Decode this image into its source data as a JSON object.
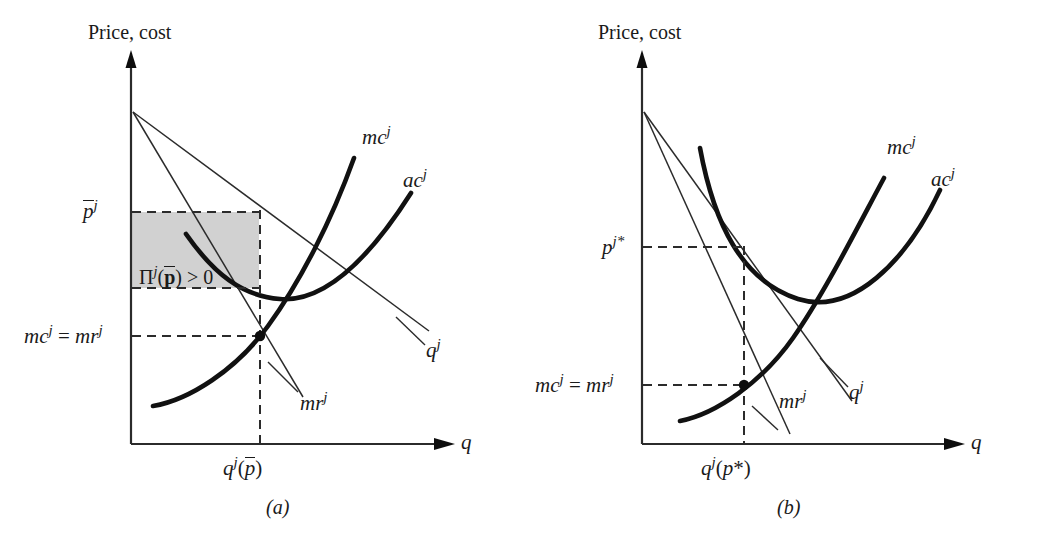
{
  "figure": {
    "width": 1038,
    "height": 546,
    "background": "#ffffff",
    "ink_color": "#1a1a1a",
    "shade_color": "#cfcfcf"
  },
  "panels": [
    {
      "id": "panel-a",
      "caption": "(a)",
      "y_axis_label": "Price, cost",
      "x_axis_label": "q",
      "price_tick_label": "p̄",
      "price_tick_sup": "j",
      "cost_tick_label": "mc",
      "cost_tick_text": "mc j = mr j",
      "x_tick_label": "q j(p̄)",
      "profit_label": "Π j(p̄) > 0",
      "profit_sign": "> 0",
      "curves": [
        {
          "name": "mc",
          "label": "mc",
          "sup": "j",
          "style": "thick"
        },
        {
          "name": "ac",
          "label": "ac",
          "sup": "j",
          "style": "thick"
        },
        {
          "name": "demand",
          "label": "q",
          "sup": "j",
          "style": "thin"
        },
        {
          "name": "marginal-revenue",
          "label": "mr",
          "sup": "j",
          "style": "thin"
        }
      ],
      "shaded_region": true,
      "shaded_region_meaning": "positive profit"
    },
    {
      "id": "panel-b",
      "caption": "(b)",
      "y_axis_label": "Price, cost",
      "x_axis_label": "q",
      "price_tick_label": "p",
      "price_tick_sup": "j*",
      "cost_tick_text": "mc j = mr j",
      "x_tick_label": "q j(p*)",
      "curves": [
        {
          "name": "mc",
          "label": "mc",
          "sup": "j",
          "style": "thick"
        },
        {
          "name": "ac",
          "label": "ac",
          "sup": "j",
          "style": "thick"
        },
        {
          "name": "demand",
          "label": "q",
          "sup": "j",
          "style": "thin"
        },
        {
          "name": "marginal-revenue",
          "label": "mr",
          "sup": "j",
          "style": "thin"
        }
      ],
      "shaded_region": false
    }
  ],
  "labels": {
    "price_cost": "Price, cost",
    "q_axis": "q",
    "mc": "mc",
    "ac": "ac",
    "mr": "mr",
    "qd": "q",
    "sup_j": "j",
    "p_bar": "p",
    "p_star_sup": "j*",
    "eq_mc_mr_left": "mc",
    "eq_symbol": " = ",
    "eq_mc_mr_right": "mr",
    "profit_pi": "Π",
    "profit_open": "(",
    "profit_p": "p",
    "profit_close": ")",
    "profit_gt": " > 0",
    "q_of_pbar_q": "q",
    "q_of_pbar_open": "(",
    "q_of_pbar_p": "p",
    "q_of_pbar_close": ")",
    "q_of_pstar_q": "q",
    "q_of_pstar_open": "(",
    "q_of_pstar_p": "p",
    "q_of_pstar_star": "*",
    "q_of_pstar_close": ")",
    "caption_a": "(a)",
    "caption_b": "(b)"
  }
}
